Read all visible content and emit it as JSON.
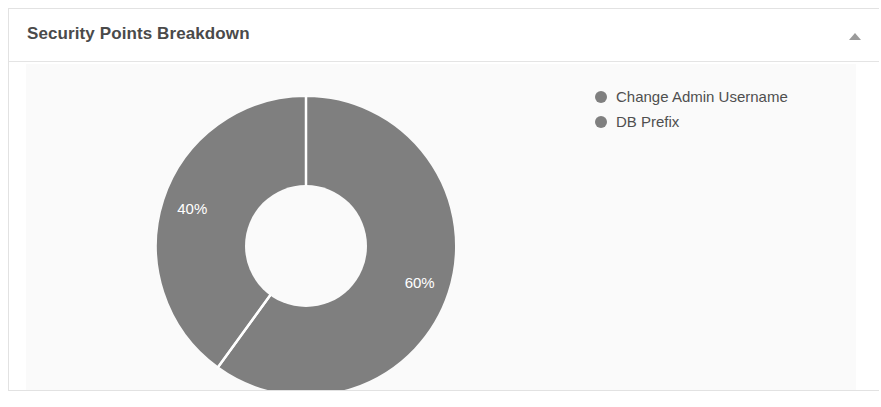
{
  "panel": {
    "title": "Security Points Breakdown",
    "collapse_icon": "caret-up-icon",
    "border_color": "#e2e2e2",
    "background": "#ffffff"
  },
  "chart_area": {
    "background": "#fafafa"
  },
  "legend": {
    "position": "top-right",
    "items": [
      {
        "label": "Change Admin Username",
        "color": "#7f7f7f",
        "marker": "circle"
      },
      {
        "label": "DB Prefix",
        "color": "#7f7f7f",
        "marker": "circle"
      }
    ]
  },
  "chart_data": {
    "type": "pie",
    "variant": "donut",
    "title": "Security Points Breakdown",
    "labels": [
      "Change Admin Username",
      "DB Prefix"
    ],
    "values": [
      60,
      40
    ],
    "value_labels": [
      "60%",
      "40%"
    ],
    "colors": [
      "#7f7f7f",
      "#7f7f7f"
    ],
    "slice_label_color": "#ffffff",
    "separator_color": "#ffffff",
    "start_angle_deg": 0,
    "direction": "clockwise",
    "inner_radius_ratio": 0.41,
    "legend_position": "top-right",
    "grid": false,
    "slices": [
      {
        "label": "Change Admin Username",
        "value": 60,
        "display": "60%",
        "color": "#7f7f7f"
      },
      {
        "label": "DB Prefix",
        "value": 40,
        "display": "40%",
        "color": "#7f7f7f"
      }
    ]
  }
}
